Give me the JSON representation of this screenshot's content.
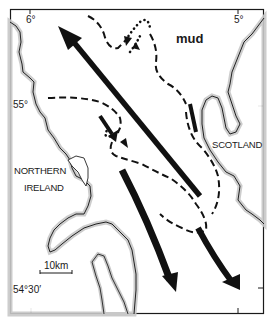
{
  "map": {
    "title": "",
    "colors": {
      "frame": "#1a1a1a",
      "coast": "#222222",
      "coast_stipple": "#b5b5b5",
      "arrow": "#111111",
      "background": "#ffffff"
    },
    "graticule": {
      "top": [
        {
          "label": "6°"
        },
        {
          "label": "5°"
        }
      ],
      "left": [
        {
          "label": "55°"
        },
        {
          "label": "54°30′"
        }
      ]
    },
    "labels": {
      "mud": "mud",
      "northern_ireland_line1": "NORTHERN",
      "northern_ireland_line2": "IRELAND",
      "scotland": "SCOTLAND"
    },
    "scale_bar": {
      "label": "10km"
    },
    "legend_items": [
      {
        "symbol": "solid-thick-arrow",
        "meaning": "sediment transport path"
      },
      {
        "symbol": "dashed-line",
        "meaning": "bedload parting / boundary"
      },
      {
        "symbol": "dotted-line",
        "meaning": "convergence"
      }
    ]
  }
}
